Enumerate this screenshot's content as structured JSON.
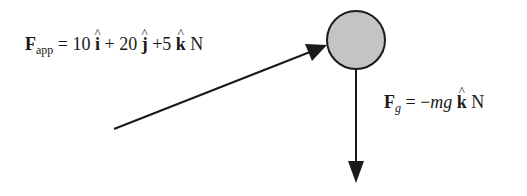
{
  "diagram": {
    "applied_force": {
      "symbol": "F",
      "subscript": "app",
      "equals": " = ",
      "i_coeff": "10 ",
      "i_unit": "i",
      "plus1": " + ",
      "j_coeff": "20 ",
      "j_unit": "j",
      "plus2": " +5 ",
      "k_unit": "k",
      "unit": " N"
    },
    "gravity_force": {
      "symbol": "F",
      "subscript": "g",
      "equals": " = −",
      "mg": "mg",
      "space": " ",
      "k_unit": "k",
      "unit": " N"
    },
    "object": {
      "shape": "circle",
      "fill": "#c4c4c4",
      "stroke": "#1a1a1a"
    },
    "arrows": [
      {
        "name": "applied-force-arrow",
        "from": [
          114,
          129
        ],
        "to": [
          327,
          45
        ]
      },
      {
        "name": "gravity-force-arrow",
        "from": [
          356,
          70
        ],
        "to": [
          356,
          182
        ]
      }
    ]
  }
}
